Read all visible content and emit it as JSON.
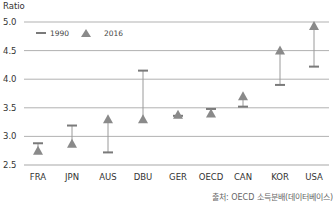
{
  "chart_data": {
    "type": "dumbbell",
    "title": "",
    "xlabel": "",
    "ylabel": "Ratio",
    "ylim": [
      2.5,
      5.0
    ],
    "yticks": [
      2.5,
      3.0,
      3.5,
      4.0,
      4.5,
      5.0
    ],
    "ytick_labels": [
      "2.5",
      "3.0",
      "3.5",
      "4.0",
      "4.5",
      "5.0"
    ],
    "grid": true,
    "legend_position": "top-left",
    "categories": [
      "FRA",
      "JPN",
      "AUS",
      "DBU",
      "GER",
      "OECD",
      "CAN",
      "KOR",
      "USA"
    ],
    "series": [
      {
        "name": "1990",
        "marker": "bar",
        "values": [
          2.88,
          3.19,
          2.72,
          4.15,
          3.36,
          3.48,
          3.52,
          3.9,
          4.22
        ]
      },
      {
        "name": "2016",
        "marker": "triangle",
        "values": [
          2.75,
          2.87,
          3.3,
          3.3,
          3.38,
          3.4,
          3.7,
          4.5,
          4.93
        ]
      }
    ],
    "colors": {
      "marker": "#8a8a8a",
      "connector": "#9a9a9a",
      "grid": "#a8a8a8",
      "text": "#333333"
    }
  },
  "labels": {
    "y_title": "Ratio",
    "source": "출처: OECD 소득분배(데이터베이스)"
  }
}
